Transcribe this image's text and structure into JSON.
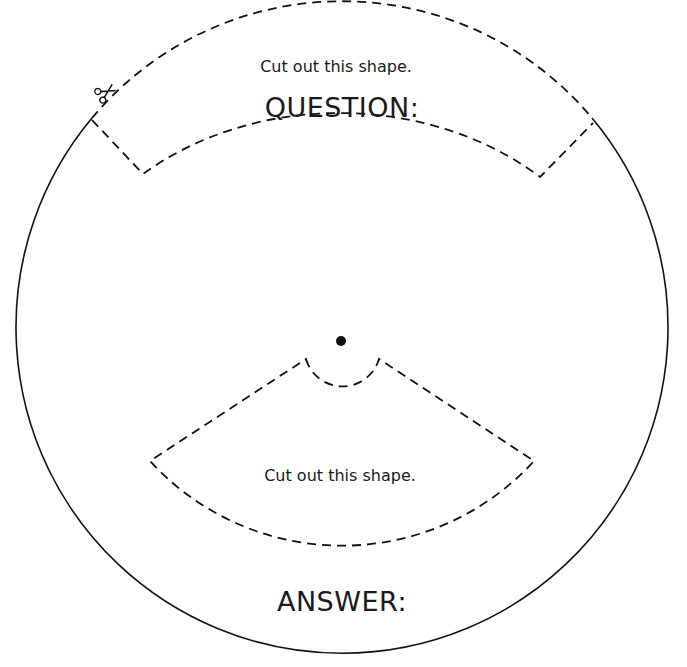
{
  "worksheet": {
    "top_piece": {
      "instruction": "Cut out this shape.",
      "heading": "QUESTION:"
    },
    "bottom_piece": {
      "instruction": "Cut out this shape.",
      "heading": "ANSWER:"
    },
    "icons": {
      "scissors": "✂",
      "center_pin": "pivot-dot"
    },
    "colors": {
      "line": "#111111",
      "background": "#ffffff"
    }
  }
}
